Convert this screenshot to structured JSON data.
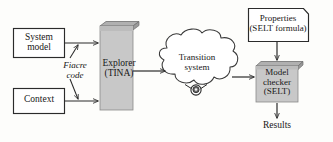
{
  "figure": {
    "background_color": "#fdfdfb",
    "stroke_color": "#2b2b2b",
    "box_fill": "#ffffff",
    "shaded_fill": "#c9c9c9",
    "shaded_top_fill": "#b3b3b3",
    "shaded_side_fill": "#9e9e9e"
  },
  "nodes": {
    "system_model": {
      "label_line1": "System",
      "label_line2": "model",
      "shape": "rectangle"
    },
    "context": {
      "label_line1": "Context",
      "label_line2": "",
      "shape": "rectangle"
    },
    "explorer": {
      "label_line1": "Explorer",
      "label_line2": "(TINA)",
      "shape": "box3d"
    },
    "transition_system": {
      "label_line1": "Transition",
      "label_line2": "system",
      "shape": "cloud"
    },
    "properties": {
      "label_line1": "Properties",
      "label_line2": "(SELT formula)",
      "shape": "folded-rectangle"
    },
    "model_checker": {
      "label_line1": "Model",
      "label_line2": "checker",
      "label_line3": "(SELT)",
      "shape": "box3d"
    },
    "results": {
      "label_line1": "Results",
      "shape": "text"
    }
  },
  "edges": [
    {
      "from": "system_model",
      "to": "explorer",
      "label": ""
    },
    {
      "from": "context",
      "to": "explorer",
      "label": ""
    },
    {
      "from": "explorer",
      "to": "transition_system",
      "label": ""
    },
    {
      "from": "transition_system",
      "to": "model_checker",
      "label": ""
    },
    {
      "from": "properties",
      "to": "model_checker",
      "label": ""
    },
    {
      "from": "model_checker",
      "to": "results",
      "label": ""
    }
  ],
  "edge_labels": {
    "fiacre_code_line1": "Fiacre",
    "fiacre_code_line2": "code"
  }
}
